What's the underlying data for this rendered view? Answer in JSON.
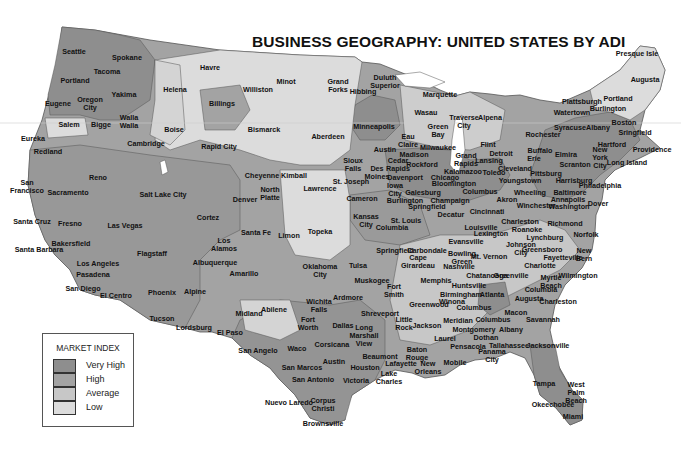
{
  "title": "BUSINESS GEOGRAPHY:  UNITED STATES BY ADI",
  "colors": {
    "very_high": "#8e8e8e",
    "high": "#a3a3a3",
    "average": "#c7c7c7",
    "low": "#dcdcdc",
    "border": "#555555",
    "background": "#ffffff"
  },
  "legend": {
    "title": "MARKET INDEX",
    "items": [
      {
        "label": "Very High",
        "color": "#8e8e8e"
      },
      {
        "label": "High",
        "color": "#a3a3a3"
      },
      {
        "label": "Average",
        "color": "#c7c7c7"
      },
      {
        "label": "Low",
        "color": "#dcdcdc"
      }
    ]
  },
  "cities": [
    {
      "name": "Seattle",
      "x": 74,
      "y": 52
    },
    {
      "name": "Spokane",
      "x": 127,
      "y": 58
    },
    {
      "name": "Tacoma",
      "x": 107,
      "y": 72
    },
    {
      "name": "Portland",
      "x": 75,
      "y": 81
    },
    {
      "name": "Yakima",
      "x": 124,
      "y": 95
    },
    {
      "name": "Eugene",
      "x": 58,
      "y": 104
    },
    {
      "name": "Oregon\nCity",
      "x": 90,
      "y": 104
    },
    {
      "name": "Salem",
      "x": 69,
      "y": 125
    },
    {
      "name": "Bigge",
      "x": 101,
      "y": 125
    },
    {
      "name": "Walla\nWalla",
      "x": 129,
      "y": 122
    },
    {
      "name": "Eureka",
      "x": 33,
      "y": 139
    },
    {
      "name": "Cambridge",
      "x": 146,
      "y": 144
    },
    {
      "name": "Havre",
      "x": 210,
      "y": 68
    },
    {
      "name": "Helena",
      "x": 175,
      "y": 90
    },
    {
      "name": "Billings",
      "x": 222,
      "y": 104
    },
    {
      "name": "Boise",
      "x": 174,
      "y": 130
    },
    {
      "name": "Williston",
      "x": 258,
      "y": 90
    },
    {
      "name": "Minot",
      "x": 286,
      "y": 82
    },
    {
      "name": "Grand\nForks",
      "x": 338,
      "y": 86
    },
    {
      "name": "Hibbing",
      "x": 363,
      "y": 92
    },
    {
      "name": "Duluth\nSuperior",
      "x": 385,
      "y": 82
    },
    {
      "name": "Bismarck",
      "x": 264,
      "y": 130
    },
    {
      "name": "Aberdeen",
      "x": 328,
      "y": 137
    },
    {
      "name": "Minneapolis",
      "x": 374,
      "y": 127
    },
    {
      "name": "Marquette",
      "x": 440,
      "y": 95
    },
    {
      "name": "Wasau",
      "x": 426,
      "y": 113
    },
    {
      "name": "Green\nBay",
      "x": 438,
      "y": 131
    },
    {
      "name": "Eau\nClaire",
      "x": 408,
      "y": 141
    },
    {
      "name": "Traverse\nCity",
      "x": 464,
      "y": 122
    },
    {
      "name": "Alpena",
      "x": 490,
      "y": 118
    },
    {
      "name": "Presque Isle",
      "x": 637,
      "y": 54
    },
    {
      "name": "Augusta",
      "x": 645,
      "y": 80
    },
    {
      "name": "Plattsburgh",
      "x": 582,
      "y": 102
    },
    {
      "name": "Portland",
      "x": 618,
      "y": 99
    },
    {
      "name": "Watertown",
      "x": 572,
      "y": 113
    },
    {
      "name": "Burlington",
      "x": 608,
      "y": 109
    },
    {
      "name": "Syracuse",
      "x": 570,
      "y": 128
    },
    {
      "name": "Albany",
      "x": 598,
      "y": 128
    },
    {
      "name": "Boston",
      "x": 624,
      "y": 123
    },
    {
      "name": "Rochester",
      "x": 543,
      "y": 135
    },
    {
      "name": "Sringfield",
      "x": 635,
      "y": 133
    },
    {
      "name": "Hartford",
      "x": 612,
      "y": 145
    },
    {
      "name": "Providence",
      "x": 652,
      "y": 150
    },
    {
      "name": "Rapid City",
      "x": 219,
      "y": 147
    },
    {
      "name": "Redland",
      "x": 48,
      "y": 152
    },
    {
      "name": "Reno",
      "x": 98,
      "y": 178
    },
    {
      "name": "San\nFrancisco",
      "x": 27,
      "y": 187
    },
    {
      "name": "Sacramento",
      "x": 68,
      "y": 193
    },
    {
      "name": "Salt Lake City",
      "x": 163,
      "y": 195
    },
    {
      "name": "Cheyenne",
      "x": 262,
      "y": 176
    },
    {
      "name": "Kimball",
      "x": 294,
      "y": 176
    },
    {
      "name": "North\nPlatte",
      "x": 270,
      "y": 194
    },
    {
      "name": "Denver",
      "x": 245,
      "y": 200
    },
    {
      "name": "Lawrence",
      "x": 320,
      "y": 189
    },
    {
      "name": "Austin",
      "x": 385,
      "y": 150
    },
    {
      "name": "Madison",
      "x": 414,
      "y": 155
    },
    {
      "name": "Milwaukee",
      "x": 438,
      "y": 148
    },
    {
      "name": "Sioux\nFalls",
      "x": 353,
      "y": 165
    },
    {
      "name": "Cedar\nRapids",
      "x": 398,
      "y": 165
    },
    {
      "name": "Rockford",
      "x": 422,
      "y": 165
    },
    {
      "name": "Grand\nRapids",
      "x": 466,
      "y": 160
    },
    {
      "name": "Lansing",
      "x": 489,
      "y": 161
    },
    {
      "name": "Flint",
      "x": 488,
      "y": 145
    },
    {
      "name": "Detroit",
      "x": 501,
      "y": 154
    },
    {
      "name": "Des\nMoines",
      "x": 377,
      "y": 173
    },
    {
      "name": "St. Joseph",
      "x": 351,
      "y": 182
    },
    {
      "name": "Davenport",
      "x": 405,
      "y": 178
    },
    {
      "name": "Chicago",
      "x": 445,
      "y": 178
    },
    {
      "name": "Kalamazoo",
      "x": 463,
      "y": 172
    },
    {
      "name": "Toledo",
      "x": 494,
      "y": 173
    },
    {
      "name": "Cleveland",
      "x": 515,
      "y": 169
    },
    {
      "name": "Bloomington",
      "x": 454,
      "y": 184
    },
    {
      "name": "Iowa\nCity",
      "x": 395,
      "y": 190
    },
    {
      "name": "Galesburg",
      "x": 423,
      "y": 193
    },
    {
      "name": "Cameron",
      "x": 362,
      "y": 199
    },
    {
      "name": "Burlington",
      "x": 405,
      "y": 201
    },
    {
      "name": "Springfield",
      "x": 427,
      "y": 207
    },
    {
      "name": "Champaign",
      "x": 450,
      "y": 201
    },
    {
      "name": "Columbus",
      "x": 480,
      "y": 192
    },
    {
      "name": "Akron",
      "x": 507,
      "y": 200
    },
    {
      "name": "Youngstown",
      "x": 520,
      "y": 181
    },
    {
      "name": "Pittsburg",
      "x": 546,
      "y": 174
    },
    {
      "name": "Wheeling",
      "x": 530,
      "y": 193
    },
    {
      "name": "Buffalo",
      "x": 540,
      "y": 151
    },
    {
      "name": "Elmira",
      "x": 566,
      "y": 155
    },
    {
      "name": "Erie",
      "x": 534,
      "y": 159
    },
    {
      "name": "Scranton",
      "x": 575,
      "y": 165
    },
    {
      "name": "New\nYork\nCity",
      "x": 600,
      "y": 158
    },
    {
      "name": "Long Island",
      "x": 627,
      "y": 163
    },
    {
      "name": "Harrisburg",
      "x": 574,
      "y": 181
    },
    {
      "name": "Philadelphia",
      "x": 600,
      "y": 186
    },
    {
      "name": "Baltimore",
      "x": 570,
      "y": 193
    },
    {
      "name": "Annapolis",
      "x": 568,
      "y": 200
    },
    {
      "name": "Washington",
      "x": 569,
      "y": 207
    },
    {
      "name": "Dover",
      "x": 598,
      "y": 204
    },
    {
      "name": "Winchester",
      "x": 536,
      "y": 206
    },
    {
      "name": "Cincinnati",
      "x": 487,
      "y": 212
    },
    {
      "name": "Decatur",
      "x": 451,
      "y": 215
    },
    {
      "name": "Kansas\nCity",
      "x": 366,
      "y": 221
    },
    {
      "name": "St. Louis",
      "x": 406,
      "y": 221
    },
    {
      "name": "Columbia",
      "x": 392,
      "y": 228
    },
    {
      "name": "Louisville",
      "x": 481,
      "y": 228
    },
    {
      "name": "Charleston",
      "x": 520,
      "y": 222
    },
    {
      "name": "Richmond",
      "x": 565,
      "y": 224
    },
    {
      "name": "Santa Cruz",
      "x": 32,
      "y": 222
    },
    {
      "name": "Fresno",
      "x": 70,
      "y": 224
    },
    {
      "name": "Las Vegas",
      "x": 125,
      "y": 226
    },
    {
      "name": "Cortez",
      "x": 208,
      "y": 218
    },
    {
      "name": "Santa Fe",
      "x": 256,
      "y": 233
    },
    {
      "name": "Limon",
      "x": 289,
      "y": 236
    },
    {
      "name": "Topeka",
      "x": 320,
      "y": 232
    },
    {
      "name": "Los\nAlamos",
      "x": 224,
      "y": 245
    },
    {
      "name": "Bakersfield",
      "x": 71,
      "y": 244
    },
    {
      "name": "Santa Barbara",
      "x": 39,
      "y": 250
    },
    {
      "name": "Flagstaff",
      "x": 152,
      "y": 254
    },
    {
      "name": "Albuquerque",
      "x": 215,
      "y": 263
    },
    {
      "name": "Evansville",
      "x": 466,
      "y": 242
    },
    {
      "name": "Lexington",
      "x": 491,
      "y": 234
    },
    {
      "name": "Roanoke",
      "x": 527,
      "y": 230
    },
    {
      "name": "Lynchburg",
      "x": 545,
      "y": 238
    },
    {
      "name": "Norfolk",
      "x": 586,
      "y": 235
    },
    {
      "name": "Springfield",
      "x": 395,
      "y": 251
    },
    {
      "name": "Carbondale",
      "x": 427,
      "y": 251
    },
    {
      "name": "Bowling\nGreen",
      "x": 462,
      "y": 258
    },
    {
      "name": "Mt. Vernon",
      "x": 489,
      "y": 257
    },
    {
      "name": "Johnson\nCity",
      "x": 521,
      "y": 249
    },
    {
      "name": "Greensboro",
      "x": 542,
      "y": 250
    },
    {
      "name": "Cape\nGirardeau",
      "x": 418,
      "y": 262
    },
    {
      "name": "Nashville",
      "x": 459,
      "y": 267
    },
    {
      "name": "Fayetteville",
      "x": 563,
      "y": 258
    },
    {
      "name": "New\nBern",
      "x": 584,
      "y": 255
    },
    {
      "name": "Los Angeles",
      "x": 98,
      "y": 264
    },
    {
      "name": "Pasadena",
      "x": 93,
      "y": 275
    },
    {
      "name": "Amarillo",
      "x": 244,
      "y": 274
    },
    {
      "name": "Oklahoma\nCity",
      "x": 320,
      "y": 271
    },
    {
      "name": "Tulsa",
      "x": 358,
      "y": 266
    },
    {
      "name": "Muskogee",
      "x": 372,
      "y": 281
    },
    {
      "name": "Memphis",
      "x": 436,
      "y": 281
    },
    {
      "name": "Charlotte",
      "x": 540,
      "y": 266
    },
    {
      "name": "San Diego",
      "x": 83,
      "y": 289
    },
    {
      "name": "El Centro",
      "x": 116,
      "y": 296
    },
    {
      "name": "Phoenix",
      "x": 162,
      "y": 293
    },
    {
      "name": "Alpine",
      "x": 195,
      "y": 292
    },
    {
      "name": "Fort\nSmith",
      "x": 394,
      "y": 291
    },
    {
      "name": "Huntsville",
      "x": 469,
      "y": 286
    },
    {
      "name": "Chatanooga",
      "x": 487,
      "y": 276
    },
    {
      "name": "Greenville",
      "x": 511,
      "y": 276
    },
    {
      "name": "Myrtle\nBeach",
      "x": 551,
      "y": 282
    },
    {
      "name": "Wilmington",
      "x": 578,
      "y": 276
    },
    {
      "name": "Birmingham",
      "x": 461,
      "y": 295
    },
    {
      "name": "Atlanta",
      "x": 492,
      "y": 295
    },
    {
      "name": "Columbia",
      "x": 541,
      "y": 290
    },
    {
      "name": "Augusta",
      "x": 529,
      "y": 299
    },
    {
      "name": "Charleston",
      "x": 558,
      "y": 302
    },
    {
      "name": "Tucson",
      "x": 162,
      "y": 319
    },
    {
      "name": "Lordsburg",
      "x": 194,
      "y": 328
    },
    {
      "name": "Midland",
      "x": 249,
      "y": 314
    },
    {
      "name": "Abilene",
      "x": 274,
      "y": 310
    },
    {
      "name": "Wichita\nFalls",
      "x": 319,
      "y": 306
    },
    {
      "name": "Ardmore",
      "x": 348,
      "y": 298
    },
    {
      "name": "Greenwood",
      "x": 429,
      "y": 305
    },
    {
      "name": "Winona",
      "x": 452,
      "y": 302
    },
    {
      "name": "Columbus",
      "x": 474,
      "y": 308
    },
    {
      "name": "Macon",
      "x": 516,
      "y": 313
    },
    {
      "name": "Savannah",
      "x": 543,
      "y": 320
    },
    {
      "name": "El Paso",
      "x": 230,
      "y": 333
    },
    {
      "name": "Fort\nWorth",
      "x": 308,
      "y": 324
    },
    {
      "name": "Dallas",
      "x": 343,
      "y": 326
    },
    {
      "name": "Shreveport",
      "x": 380,
      "y": 314
    },
    {
      "name": "Little\nRock",
      "x": 404,
      "y": 324
    },
    {
      "name": "Jackson",
      "x": 427,
      "y": 326
    },
    {
      "name": "Meridian",
      "x": 458,
      "y": 321
    },
    {
      "name": "Columbus",
      "x": 493,
      "y": 320
    },
    {
      "name": "Montgomery",
      "x": 474,
      "y": 330
    },
    {
      "name": "Albany",
      "x": 511,
      "y": 330
    },
    {
      "name": "Long\nMarshall\nView",
      "x": 364,
      "y": 336
    },
    {
      "name": "Corsicana",
      "x": 332,
      "y": 345
    },
    {
      "name": "Laurel",
      "x": 445,
      "y": 339
    },
    {
      "name": "Dothan",
      "x": 486,
      "y": 338
    },
    {
      "name": "Tallahassee",
      "x": 509,
      "y": 346
    },
    {
      "name": "Jacksonville",
      "x": 548,
      "y": 346
    },
    {
      "name": "San Angelo",
      "x": 258,
      "y": 351
    },
    {
      "name": "Waco",
      "x": 297,
      "y": 349
    },
    {
      "name": "Baton\nRouge",
      "x": 417,
      "y": 354
    },
    {
      "name": "Pensacola",
      "x": 468,
      "y": 347
    },
    {
      "name": "Panama\nCity",
      "x": 492,
      "y": 356
    },
    {
      "name": "Austin",
      "x": 334,
      "y": 362
    },
    {
      "name": "Beaumont",
      "x": 380,
      "y": 357
    },
    {
      "name": "Lafayette",
      "x": 401,
      "y": 364
    },
    {
      "name": "New\nOrleans",
      "x": 428,
      "y": 368
    },
    {
      "name": "Mobile",
      "x": 455,
      "y": 363
    },
    {
      "name": "Houston",
      "x": 365,
      "y": 368
    },
    {
      "name": "San Marcos",
      "x": 302,
      "y": 368
    },
    {
      "name": "San Antonio",
      "x": 313,
      "y": 380
    },
    {
      "name": "Victoria",
      "x": 356,
      "y": 381
    },
    {
      "name": "Lake\nCharles",
      "x": 389,
      "y": 378
    },
    {
      "name": "Tampa",
      "x": 544,
      "y": 384
    },
    {
      "name": "West\nPalm\nBeach",
      "x": 576,
      "y": 393
    },
    {
      "name": "Okeechobee",
      "x": 553,
      "y": 405
    },
    {
      "name": "Miami",
      "x": 573,
      "y": 417
    },
    {
      "name": "Nuevo Laredo",
      "x": 289,
      "y": 403
    },
    {
      "name": "Corpus\nChristi",
      "x": 323,
      "y": 405
    },
    {
      "name": "Brownsville",
      "x": 323,
      "y": 424
    }
  ]
}
